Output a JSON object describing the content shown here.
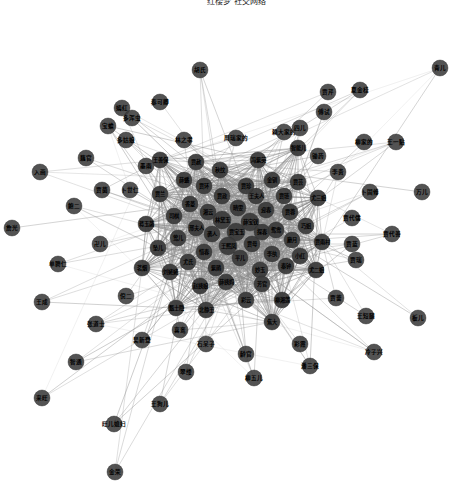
{
  "title": "红楼梦 社交网络",
  "colors": {
    "background": "#ffffff",
    "node_fill": "#3b3b3b",
    "node_stroke": "#2a2a2a",
    "edge": "#8c8c8c",
    "label": "#000000"
  },
  "chart_data": {
    "type": "scatter",
    "title": "红楼梦 社交网络",
    "xlabel": "",
    "ylabel": "",
    "graph_type": "force-directed-network",
    "layout": "radial-hairball",
    "grid": false,
    "legend": null,
    "axis_visible": false,
    "node_count": 108,
    "node_radius": 8,
    "center": [
      236,
      232
    ],
    "nodes": [
      {
        "id": 0,
        "label": "贾宝玉",
        "x": 236,
        "y": 232,
        "r": 9,
        "core": true
      },
      {
        "id": 1,
        "label": "林黛玉",
        "x": 222,
        "y": 220,
        "r": 9,
        "core": true
      },
      {
        "id": 2,
        "label": "薛宝钗",
        "x": 250,
        "y": 222,
        "r": 9,
        "core": true
      },
      {
        "id": 3,
        "label": "王熙凤",
        "x": 228,
        "y": 246,
        "r": 9,
        "core": true
      },
      {
        "id": 4,
        "label": "贾母",
        "x": 252,
        "y": 244,
        "r": 8,
        "core": true
      },
      {
        "id": 5,
        "label": "袭人",
        "x": 212,
        "y": 234,
        "r": 8,
        "core": true
      },
      {
        "id": 6,
        "label": "探春",
        "x": 262,
        "y": 232,
        "r": 8,
        "core": true
      },
      {
        "id": 7,
        "label": "晴雯",
        "x": 238,
        "y": 208,
        "r": 8,
        "core": true
      },
      {
        "id": 8,
        "label": "平儿",
        "x": 240,
        "y": 258,
        "r": 8,
        "core": true
      },
      {
        "id": 9,
        "label": "湘云",
        "x": 208,
        "y": 212,
        "r": 8,
        "core": true
      },
      {
        "id": 10,
        "label": "迎春",
        "x": 266,
        "y": 210,
        "r": 8,
        "core": true
      },
      {
        "id": 11,
        "label": "惜春",
        "x": 204,
        "y": 252,
        "r": 8,
        "core": true
      },
      {
        "id": 12,
        "label": "李纨",
        "x": 272,
        "y": 254,
        "r": 8,
        "core": true
      },
      {
        "id": 13,
        "label": "贾政",
        "x": 222,
        "y": 196,
        "r": 8,
        "core": true
      },
      {
        "id": 14,
        "label": "王夫人",
        "x": 256,
        "y": 196,
        "r": 8,
        "core": true
      },
      {
        "id": 15,
        "label": "邢夫人",
        "x": 196,
        "y": 228,
        "r": 8,
        "core": true
      },
      {
        "id": 16,
        "label": "鸳鸯",
        "x": 276,
        "y": 230,
        "r": 8,
        "core": true
      },
      {
        "id": 17,
        "label": "紫鹃",
        "x": 216,
        "y": 268,
        "r": 8,
        "core": true
      },
      {
        "id": 18,
        "label": "妙玉",
        "x": 260,
        "y": 270,
        "r": 8,
        "core": true
      },
      {
        "id": 19,
        "label": "香菱",
        "x": 190,
        "y": 204,
        "r": 8,
        "core": true
      },
      {
        "id": 20,
        "label": "贾琏",
        "x": 284,
        "y": 196,
        "r": 8,
        "core": true
      },
      {
        "id": 21,
        "label": "尤氏",
        "x": 188,
        "y": 262,
        "r": 8,
        "core": true
      },
      {
        "id": 22,
        "label": "秦钟",
        "x": 286,
        "y": 266,
        "r": 8,
        "core": true
      },
      {
        "id": 23,
        "label": "贾珍",
        "x": 246,
        "y": 186,
        "r": 8,
        "core": true
      },
      {
        "id": 24,
        "label": "薛姨妈",
        "x": 226,
        "y": 282,
        "r": 8,
        "core": true
      },
      {
        "id": 25,
        "label": "莺儿",
        "x": 178,
        "y": 238,
        "r": 8,
        "core": true
      },
      {
        "id": 26,
        "label": "麝月",
        "x": 292,
        "y": 240,
        "r": 8,
        "core": true
      },
      {
        "id": 27,
        "label": "芳官",
        "x": 262,
        "y": 284,
        "r": 8,
        "core": true
      },
      {
        "id": 28,
        "label": "贾环",
        "x": 204,
        "y": 186,
        "r": 8,
        "core": true
      },
      {
        "id": 29,
        "label": "贾蓉",
        "x": 290,
        "y": 212,
        "r": 8,
        "core": true
      },
      {
        "id": 30,
        "label": "赵姨娘",
        "x": 200,
        "y": 286,
        "r": 8,
        "core": true
      },
      {
        "id": 31,
        "label": "司棋",
        "x": 174,
        "y": 216,
        "r": 8,
        "core": true
      },
      {
        "id": 32,
        "label": "小红",
        "x": 300,
        "y": 256,
        "r": 8,
        "core": true
      },
      {
        "id": 33,
        "label": "彩云",
        "x": 246,
        "y": 300,
        "r": 8,
        "core": true
      },
      {
        "id": 34,
        "label": "金钏",
        "x": 272,
        "y": 180,
        "r": 8,
        "core": true
      },
      {
        "id": 35,
        "label": "薛蟠",
        "x": 184,
        "y": 180,
        "r": 8,
        "core": true
      },
      {
        "id": 36,
        "label": "巧姐",
        "x": 306,
        "y": 226,
        "r": 8,
        "core": true
      },
      {
        "id": 37,
        "label": "刘姥姥",
        "x": 170,
        "y": 272,
        "r": 8,
        "core": true
      },
      {
        "id": 38,
        "label": "贾芸",
        "x": 298,
        "y": 182,
        "r": 8,
        "core": true
      },
      {
        "id": 39,
        "label": "秋纹",
        "x": 220,
        "y": 170,
        "r": 8,
        "core": true
      },
      {
        "id": 40,
        "label": "坠儿",
        "x": 158,
        "y": 248,
        "r": 8,
        "core": true
      },
      {
        "id": 41,
        "label": "柳湘莲",
        "x": 282,
        "y": 300,
        "r": 8,
        "core": true
      },
      {
        "id": 42,
        "label": "贾赦",
        "x": 196,
        "y": 162,
        "r": 8,
        "core": true
      },
      {
        "id": 43,
        "label": "尤三姐",
        "x": 318,
        "y": 198,
        "r": 8,
        "core": true
      },
      {
        "id": 44,
        "label": "尤二姐",
        "x": 316,
        "y": 270,
        "r": 8,
        "core": true
      },
      {
        "id": 45,
        "label": "贾兰",
        "x": 160,
        "y": 194,
        "r": 8,
        "core": true
      },
      {
        "id": 46,
        "label": "北静王",
        "x": 206,
        "y": 310,
        "r": 8,
        "core": true
      },
      {
        "id": 47,
        "label": "冯紫英",
        "x": 258,
        "y": 160,
        "r": 8,
        "core": true
      },
      {
        "id": 48,
        "label": "蒋玉菡",
        "x": 146,
        "y": 224,
        "r": 8,
        "core": true
      },
      {
        "id": 49,
        "label": "贾雨村",
        "x": 322,
        "y": 242,
        "r": 8,
        "core": true
      },
      {
        "id": 50,
        "label": "甄士隐",
        "x": 176,
        "y": 308,
        "r": 8,
        "core": true
      },
      {
        "id": 51,
        "label": "智能儿",
        "x": 298,
        "y": 148,
        "r": 8,
        "core": true
      },
      {
        "id": 52,
        "label": "茗烟",
        "x": 142,
        "y": 268,
        "r": 8,
        "core": true
      },
      {
        "id": 53,
        "label": "焦大",
        "x": 272,
        "y": 322,
        "r": 8,
        "core": true
      },
      {
        "id": 54,
        "label": "王善保",
        "x": 160,
        "y": 160,
        "r": 8,
        "core": true
      },
      {
        "id": 55,
        "label": "周瑞家的",
        "x": 236,
        "y": 138,
        "r": 8,
        "core": false
      },
      {
        "id": 56,
        "label": "赖大家的",
        "x": 284,
        "y": 132,
        "r": 8,
        "core": false
      },
      {
        "id": 57,
        "label": "林之孝",
        "x": 184,
        "y": 140,
        "r": 8,
        "core": false
      },
      {
        "id": 58,
        "label": "李贵",
        "x": 338,
        "y": 172,
        "r": 8,
        "core": false
      },
      {
        "id": 59,
        "label": "贾蔷",
        "x": 336,
        "y": 298,
        "r": 8,
        "core": false
      },
      {
        "id": 60,
        "label": "卜世仁",
        "x": 130,
        "y": 190,
        "r": 8,
        "core": false
      },
      {
        "id": 61,
        "label": "倪二",
        "x": 126,
        "y": 296,
        "r": 8,
        "core": false
      },
      {
        "id": 62,
        "label": "石呆子",
        "x": 206,
        "y": 344,
        "r": 8,
        "core": false
      },
      {
        "id": 63,
        "label": "贾代儒",
        "x": 352,
        "y": 218,
        "r": 8,
        "core": false
      },
      {
        "id": 64,
        "label": "多姑娘",
        "x": 126,
        "y": 140,
        "r": 8,
        "core": false
      },
      {
        "id": 65,
        "label": "傅试",
        "x": 324,
        "y": 112,
        "r": 8,
        "core": false
      },
      {
        "id": 66,
        "label": "卍儿",
        "x": 100,
        "y": 244,
        "r": 8,
        "core": false
      },
      {
        "id": 67,
        "label": "秦可卿",
        "x": 160,
        "y": 102,
        "r": 8,
        "core": false
      },
      {
        "id": 68,
        "label": "贾瑞",
        "x": 356,
        "y": 260,
        "r": 8,
        "core": false
      },
      {
        "id": 69,
        "label": "龄官",
        "x": 246,
        "y": 354,
        "r": 8,
        "core": false
      },
      {
        "id": 70,
        "label": "贾菌",
        "x": 102,
        "y": 190,
        "r": 8,
        "core": false
      },
      {
        "id": 71,
        "label": "柳家的",
        "x": 364,
        "y": 142,
        "r": 8,
        "core": false
      },
      {
        "id": 72,
        "label": "吴新登",
        "x": 142,
        "y": 340,
        "r": 8,
        "core": false
      },
      {
        "id": 73,
        "label": "彩霞",
        "x": 300,
        "y": 344,
        "r": 8,
        "core": false
      },
      {
        "id": 74,
        "label": "鲍二",
        "x": 74,
        "y": 206,
        "r": 8,
        "core": false
      },
      {
        "id": 75,
        "label": "嫣红",
        "x": 122,
        "y": 108,
        "r": 8,
        "core": false
      },
      {
        "id": 76,
        "label": "卜固修",
        "x": 370,
        "y": 192,
        "r": 8,
        "core": false
      },
      {
        "id": 77,
        "label": "翠缕",
        "x": 186,
        "y": 372,
        "r": 8,
        "core": false
      },
      {
        "id": 78,
        "label": "王短腿",
        "x": 366,
        "y": 316,
        "r": 8,
        "core": false
      },
      {
        "id": 79,
        "label": "藕官",
        "x": 86,
        "y": 158,
        "r": 8,
        "core": false
      },
      {
        "id": 80,
        "label": "柳五儿",
        "x": 254,
        "y": 378,
        "r": 8,
        "core": false
      },
      {
        "id": 81,
        "label": "入画",
        "x": 40,
        "y": 172,
        "r": 8,
        "core": false
      },
      {
        "id": 82,
        "label": "贾代善",
        "x": 392,
        "y": 234,
        "r": 8,
        "core": false
      },
      {
        "id": 83,
        "label": "张道士",
        "x": 96,
        "y": 324,
        "r": 8,
        "core": false
      },
      {
        "id": 84,
        "label": "潘三保",
        "x": 310,
        "y": 366,
        "r": 8,
        "core": false
      },
      {
        "id": 85,
        "label": "单聘仁",
        "x": 58,
        "y": 264,
        "r": 8,
        "core": false
      },
      {
        "id": 86,
        "label": "王成",
        "x": 42,
        "y": 302,
        "r": 8,
        "core": false
      },
      {
        "id": 87,
        "label": "夏金桂",
        "x": 360,
        "y": 90,
        "r": 8,
        "core": false
      },
      {
        "id": 88,
        "label": "宝蟾",
        "x": 108,
        "y": 126,
        "r": 8,
        "core": false
      },
      {
        "id": 89,
        "label": "万儿",
        "x": 422,
        "y": 192,
        "r": 8,
        "core": false
      },
      {
        "id": 90,
        "label": "詹光",
        "x": 12,
        "y": 228,
        "r": 8,
        "core": false
      },
      {
        "id": 91,
        "label": "冷子兴",
        "x": 374,
        "y": 352,
        "r": 8,
        "core": false
      },
      {
        "id": 92,
        "label": "智通",
        "x": 76,
        "y": 362,
        "r": 8,
        "core": false
      },
      {
        "id": 93,
        "label": "王狗儿",
        "x": 160,
        "y": 404,
        "r": 8,
        "core": false
      },
      {
        "id": 94,
        "label": "青儿",
        "x": 440,
        "y": 68,
        "r": 8,
        "core": false
      },
      {
        "id": 95,
        "label": "板儿",
        "x": 418,
        "y": 318,
        "r": 8,
        "core": false
      },
      {
        "id": 96,
        "label": "旺儿媳妇",
        "x": 114,
        "y": 424,
        "r": 8,
        "core": false
      },
      {
        "id": 97,
        "label": "来旺",
        "x": 42,
        "y": 398,
        "r": 8,
        "core": false
      },
      {
        "id": 98,
        "label": "金荣",
        "x": 115,
        "y": 472,
        "r": 8,
        "core": false
      },
      {
        "id": 99,
        "label": "胡氏",
        "x": 200,
        "y": 70,
        "r": 8,
        "core": false
      },
      {
        "id": 100,
        "label": "贾芹",
        "x": 328,
        "y": 92,
        "r": 8,
        "core": false
      },
      {
        "id": 101,
        "label": "王一贴",
        "x": 396,
        "y": 142,
        "r": 8,
        "core": false
      },
      {
        "id": 102,
        "label": "多浑虫",
        "x": 132,
        "y": 118,
        "r": 8,
        "core": false
      },
      {
        "id": 103,
        "label": "贾蓝",
        "x": 352,
        "y": 244,
        "r": 8,
        "core": false
      },
      {
        "id": 104,
        "label": "喜鸾",
        "x": 180,
        "y": 330,
        "r": 8,
        "core": false
      },
      {
        "id": 105,
        "label": "四儿",
        "x": 300,
        "y": 128,
        "r": 8,
        "core": false
      },
      {
        "id": 106,
        "label": "墨雨",
        "x": 146,
        "y": 166,
        "r": 8,
        "core": false
      },
      {
        "id": 107,
        "label": "锄药",
        "x": 318,
        "y": 156,
        "r": 8,
        "core": false
      }
    ]
  }
}
